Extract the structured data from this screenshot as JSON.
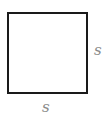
{
  "diagram": {
    "shape": "square",
    "labels": {
      "right_side": "s",
      "bottom_side": "s"
    },
    "colors": {
      "stroke": "#1a1a1a",
      "label": "#8a8a8a",
      "background": "#ffffff"
    }
  }
}
